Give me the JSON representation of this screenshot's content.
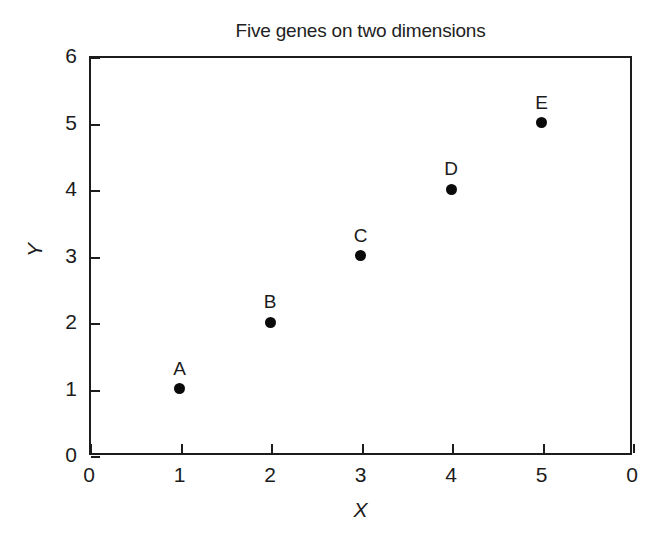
{
  "chart_data": {
    "type": "scatter",
    "title": "Five genes on two dimensions",
    "xlabel": "X",
    "ylabel": "Y",
    "xlim": [
      0,
      6
    ],
    "ylim": [
      0,
      6
    ],
    "grid": false,
    "legend": "none",
    "xticks": [
      {
        "value": 0,
        "label": "0"
      },
      {
        "value": 1,
        "label": "1"
      },
      {
        "value": 2,
        "label": "2"
      },
      {
        "value": 3,
        "label": "3"
      },
      {
        "value": 4,
        "label": "4"
      },
      {
        "value": 5,
        "label": "5"
      },
      {
        "value": 6,
        "label": "0"
      }
    ],
    "yticks": [
      {
        "value": 0,
        "label": "0"
      },
      {
        "value": 1,
        "label": "1"
      },
      {
        "value": 2,
        "label": "2"
      },
      {
        "value": 3,
        "label": "3"
      },
      {
        "value": 4,
        "label": "4"
      },
      {
        "value": 5,
        "label": "5"
      },
      {
        "value": 6,
        "label": "6"
      }
    ],
    "points": [
      {
        "label": "A",
        "x": 1,
        "y": 1
      },
      {
        "label": "B",
        "x": 2,
        "y": 2
      },
      {
        "label": "C",
        "x": 3,
        "y": 3
      },
      {
        "label": "D",
        "x": 4,
        "y": 4
      },
      {
        "label": "E",
        "x": 5,
        "y": 5
      }
    ],
    "marker_color": "#0a0a0a",
    "frame_color": "#1c1c1c",
    "background_color": "#ffffff"
  }
}
